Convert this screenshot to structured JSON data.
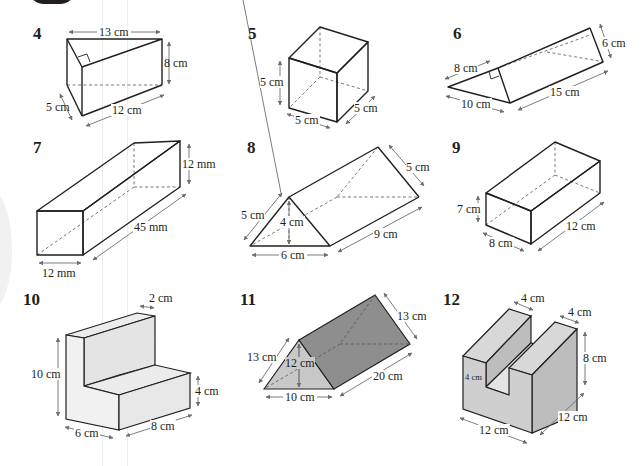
{
  "exercise": {
    "problems": [
      {
        "number": "4",
        "shape": "triangular-prism-right-angle",
        "labels": {
          "top": "13 cm",
          "height": "8 cm",
          "depth": "5 cm",
          "length": "12 cm"
        }
      },
      {
        "number": "5",
        "shape": "cube",
        "labels": {
          "height": "5 cm",
          "width": "5 cm",
          "depth": "5 cm"
        }
      },
      {
        "number": "6",
        "shape": "triangular-prism-right-angle",
        "labels": {
          "side": "8 cm",
          "base": "10 cm",
          "length": "15 cm",
          "end": "6 cm"
        }
      },
      {
        "number": "7",
        "shape": "square-cuboid",
        "labels": {
          "height": "12 mm",
          "length": "45 mm",
          "width": "12 mm"
        }
      },
      {
        "number": "8",
        "shape": "triangular-prism",
        "labels": {
          "slant": "5 cm",
          "height": "4 cm",
          "base": "6 cm",
          "length": "9 cm",
          "back": "5 cm"
        }
      },
      {
        "number": "9",
        "shape": "cuboid",
        "labels": {
          "height": "7 cm",
          "width": "8 cm",
          "length": "12 cm"
        }
      },
      {
        "number": "10",
        "shape": "L-shaped-prism",
        "labels": {
          "top_width": "2 cm",
          "height": "10 cm",
          "step_height": "4 cm",
          "width": "6 cm",
          "depth": "8 cm"
        }
      },
      {
        "number": "11",
        "shape": "triangular-prism",
        "labels": {
          "slant": "13 cm",
          "height": "12 cm",
          "base": "10 cm",
          "length": "20 cm",
          "back": "13 cm"
        }
      },
      {
        "number": "12",
        "shape": "U-shaped-prism",
        "labels": {
          "slot_width": "4 cm",
          "wall_width": "4 cm",
          "height": "8 cm",
          "slot_depth": "4 cm",
          "depth": "12 cm",
          "width": "12 cm"
        }
      }
    ]
  }
}
